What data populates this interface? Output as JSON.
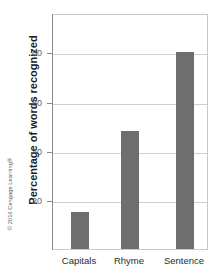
{
  "chart_data": {
    "type": "bar",
    "title": "",
    "xlabel": "",
    "ylabel": "Percentage of words recognized",
    "categories": [
      "Capitals",
      "Rhyme",
      "Sentence"
    ],
    "values": [
      15,
      48,
      80
    ],
    "ylim": [
      0,
      96
    ],
    "yticks": [
      20,
      40,
      60,
      80
    ],
    "ytick_labels": [
      "20",
      "40",
      "60",
      "80"
    ],
    "grid": "horizontal",
    "legend": "none",
    "bar_color": "#6e6e6e",
    "series": [
      {
        "name": "Percentage of words recognized",
        "values": [
          15,
          48,
          80
        ]
      }
    ]
  },
  "credit": {
    "text": "© 2016 Cengage Learning®"
  }
}
